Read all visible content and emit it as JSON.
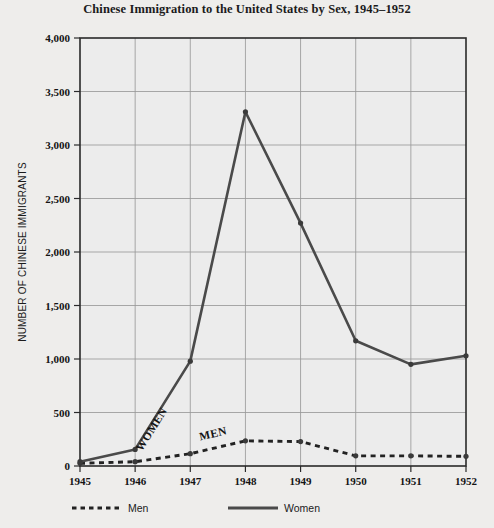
{
  "chart_data": {
    "type": "line",
    "title": "Chinese Immigration to the United States by Sex, 1945–1952",
    "xlabel": "",
    "ylabel": "NUMBER OF CHINESE IMMIGRANTS",
    "categories": [
      "1945",
      "1946",
      "1947",
      "1948",
      "1949",
      "1950",
      "1951",
      "1952"
    ],
    "x": [
      1945,
      1946,
      1947,
      1948,
      1949,
      1950,
      1951,
      1952
    ],
    "xlim": [
      1945,
      1952
    ],
    "ylim": [
      0,
      4000
    ],
    "ytick_values": [
      0,
      500,
      1000,
      1500,
      2000,
      2500,
      3000,
      3500,
      4000
    ],
    "ytick_labels": [
      "0",
      "500",
      "1,000",
      "1,500",
      "2,000",
      "2,500",
      "3,000",
      "3,500",
      "4,000"
    ],
    "grid": true,
    "legend_position": "bottom",
    "series": [
      {
        "name": "Men",
        "style": "dashed",
        "color": "#222222",
        "values": [
          25,
          40,
          115,
          235,
          228,
          95,
          95,
          90
        ],
        "inline_label": "MEN"
      },
      {
        "name": "Women",
        "style": "solid",
        "color": "#4a4a4a",
        "values": [
          40,
          155,
          980,
          3310,
          2270,
          1170,
          950,
          1030
        ],
        "inline_label": "WOMEN"
      }
    ]
  },
  "legend": {
    "items": [
      {
        "label": "Men",
        "style": "dashed"
      },
      {
        "label": "Women",
        "style": "solid"
      }
    ]
  },
  "colors": {
    "page_background": "#eeedeb",
    "plot_background": "#ececec",
    "frame": "#2a2a2a",
    "grid": "#9a9a9a"
  }
}
